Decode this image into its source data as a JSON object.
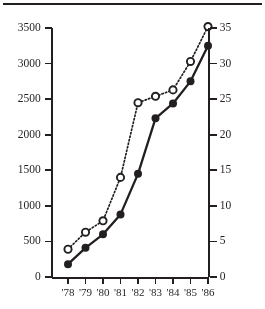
{
  "figure": {
    "has_top_rule": true,
    "background": "#ffffff",
    "ink": "#231f20"
  },
  "chart_data": {
    "type": "line",
    "title": "",
    "subtitle": "",
    "xlabel": "",
    "ylabel": "",
    "grid": false,
    "legend": "none",
    "categories": [
      "'78",
      "'79",
      "'80",
      "'81",
      "'82",
      "'83",
      "'84",
      "'85",
      "'86"
    ],
    "axes": {
      "x": {
        "tick_labels": [
          "'78",
          "'79",
          "'80",
          "'81",
          "'82",
          "'83",
          "'84",
          "'85",
          "'86"
        ]
      },
      "y_left": {
        "ylim": [
          0,
          3500
        ],
        "ticks": [
          0,
          500,
          1000,
          1500,
          2000,
          2500,
          3000,
          3500
        ],
        "tick_labels": [
          "0",
          "500",
          "1000",
          "1500",
          "2000",
          "2500",
          "3000",
          "3500"
        ],
        "label": ""
      },
      "y_right": {
        "ylim": [
          0,
          35
        ],
        "ticks": [
          0,
          5,
          10,
          15,
          20,
          25,
          30,
          35
        ],
        "tick_labels": [
          "0",
          "5",
          "10",
          "15",
          "20",
          "25",
          "30",
          "35"
        ],
        "label": ""
      }
    },
    "series": [
      {
        "name": "solid-filled-series",
        "axis": "y_left",
        "marker": "filled-circle",
        "line_style": "solid",
        "color": "#000000",
        "values": [
          180,
          410,
          600,
          880,
          1450,
          2230,
          2440,
          2750,
          3250
        ]
      },
      {
        "name": "dotted-open-series",
        "axis": "y_right",
        "marker": "open-circle",
        "line_style": "dotted",
        "color": "#000000",
        "values": [
          3.9,
          6.3,
          7.9,
          14.0,
          24.5,
          25.4,
          26.3,
          30.3,
          35.2
        ]
      }
    ]
  }
}
